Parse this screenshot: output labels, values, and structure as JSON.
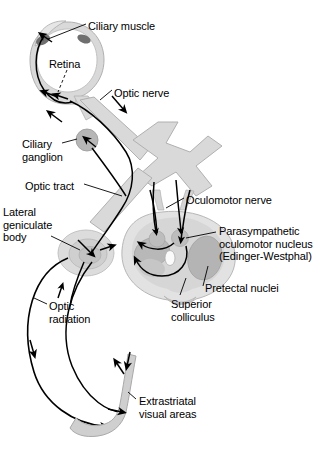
{
  "figure": {
    "top_caption_partial": "",
    "colors": {
      "background": "#ffffff",
      "stroke": "#000000",
      "tract_fill": "#d9d9d9",
      "tract_stroke": "#a8a8a8",
      "brainstem_fill": "#e0e0e0",
      "brainstem_inner": "#d2d2d2",
      "nucleus_fill": "#b5b5b5",
      "ciliary_muscle": "#7a7a7a",
      "ganglion_fill": "#b0b0b0",
      "aqueduct_fill": "#fafafa",
      "text": "#000000"
    }
  },
  "labels": [
    {
      "id": "ciliary-muscle",
      "text": "Ciliary muscle",
      "x": 88,
      "y": 20
    },
    {
      "id": "retina",
      "text": "Retina",
      "x": 49,
      "y": 58
    },
    {
      "id": "optic-nerve",
      "text": "Optic nerve",
      "x": 114,
      "y": 87
    },
    {
      "id": "ciliary-ganglion",
      "text": "Ciliary\nganglion",
      "x": 22,
      "y": 138
    },
    {
      "id": "optic-tract",
      "text": "Optic tract",
      "x": 25,
      "y": 180
    },
    {
      "id": "lateral-geniculate",
      "text": "Lateral\ngeniculate\nbody",
      "x": 3,
      "y": 206
    },
    {
      "id": "oculomotor-nerve",
      "text": "Oculomotor nerve",
      "x": 186,
      "y": 194
    },
    {
      "id": "parasympathetic",
      "text": "Parasympathetic\noculomotor nucleus\n(Edinger-Westphal)",
      "x": 219,
      "y": 225
    },
    {
      "id": "pretectal-nuclei",
      "text": "Pretectal nuclei",
      "x": 205,
      "y": 282
    },
    {
      "id": "superior-colliculus",
      "text": "Superior\ncolliculus",
      "x": 171,
      "y": 298
    },
    {
      "id": "optic-radiation",
      "text": "Optic\nradiation",
      "x": 49,
      "y": 300
    },
    {
      "id": "extrastriatal",
      "text": "Extrastriatal\nvisual areas",
      "x": 139,
      "y": 395
    }
  ]
}
